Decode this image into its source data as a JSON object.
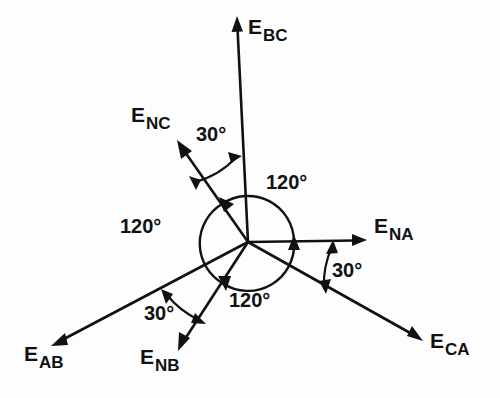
{
  "figure": {
    "type": "phasor-diagram",
    "origin": {
      "x": 248,
      "y": 242
    },
    "background_color": "#fdfdfd",
    "line_color": "#111111"
  },
  "vectors": [
    {
      "id": "ebc",
      "symbol": "E",
      "subscript": "BC",
      "angle_deg": 90,
      "length_px": 224,
      "label_x": 248,
      "label_y": 16
    },
    {
      "id": "enc",
      "symbol": "E",
      "subscript": "NC",
      "angle_deg": 125,
      "length_px": 122,
      "label_x": 131,
      "label_y": 104
    },
    {
      "id": "ena",
      "symbol": "E",
      "subscript": "NA",
      "angle_deg": 0,
      "length_px": 118,
      "label_x": 374,
      "label_y": 215
    },
    {
      "id": "eca",
      "symbol": "E",
      "subscript": "CA",
      "angle_deg": -29.5,
      "length_px": 200,
      "label_x": 430,
      "label_y": 330
    },
    {
      "id": "enb",
      "symbol": "E",
      "subscript": "NB",
      "angle_deg": -123,
      "length_px": 129,
      "label_x": 140,
      "label_y": 346
    },
    {
      "id": "eab",
      "symbol": "E",
      "subscript": "AB",
      "angle_deg": -152,
      "length_px": 222,
      "label_x": 24,
      "label_y": 343
    }
  ],
  "angle_annotations": [
    {
      "id": "deg30-top",
      "text": "30°",
      "value": 30,
      "between": [
        "enc",
        "ebc"
      ],
      "label_x": 196,
      "label_y": 124
    },
    {
      "id": "deg30-right",
      "text": "30°",
      "value": 30,
      "between": [
        "ena",
        "eca"
      ],
      "label_x": 332,
      "label_y": 260
    },
    {
      "id": "deg30-bottomleft",
      "text": "30°",
      "value": 30,
      "between": [
        "eab",
        "enb"
      ],
      "label_x": 144,
      "label_y": 303
    },
    {
      "id": "deg120-top",
      "text": "120°",
      "value": 120,
      "between": [
        "enc",
        "ena"
      ],
      "label_x": 266,
      "label_y": 172
    },
    {
      "id": "deg120-left",
      "text": "120°",
      "value": 120,
      "between": [
        "enb",
        "enc"
      ],
      "label_x": 120,
      "label_y": 216
    },
    {
      "id": "deg120-bottom",
      "text": "120°",
      "value": 120,
      "between": [
        "ena",
        "enb"
      ],
      "label_x": 229,
      "label_y": 290
    }
  ],
  "arc": {
    "radius_px": 46,
    "description": "circular arc through the three 120-degree sectors with arrowheads at each phasor"
  }
}
